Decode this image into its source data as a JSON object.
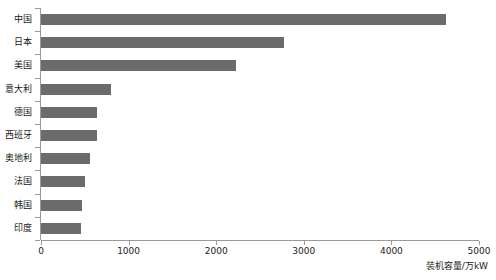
{
  "chart_data": {
    "type": "bar",
    "orientation": "horizontal",
    "title": "",
    "xlabel": "装机容量/万kW",
    "ylabel": "",
    "categories": [
      "中国",
      "日本",
      "美国",
      "意大利",
      "德国",
      "西班牙",
      "奥地利",
      "法国",
      "韩国",
      "印度"
    ],
    "values": [
      4620,
      2770,
      2230,
      800,
      640,
      640,
      560,
      500,
      470,
      460
    ],
    "xlim": [
      0,
      5000
    ],
    "xticks": [
      0,
      1000,
      2000,
      3000,
      4000,
      5000
    ],
    "xtick_labels": [
      "0",
      "1000",
      "2000",
      "3000",
      "4000",
      "5000"
    ],
    "grid": false,
    "legend": false,
    "bar_color": "#6b6b6b",
    "axis_color": "#9a9a9a",
    "background": "#ffffff"
  }
}
